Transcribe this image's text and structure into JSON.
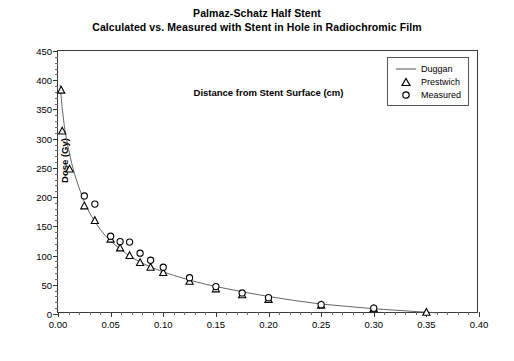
{
  "chart_data": {
    "type": "scatter",
    "title": "Palmaz-Schatz Half Stent",
    "subtitle": "Calculated vs. Measured with Stent in Hole in Radiochromic Film",
    "xlabel": "Distance from Stent Surface (cm)",
    "ylabel": "Dose (Gy)",
    "xlim": [
      0.0,
      0.4
    ],
    "ylim": [
      0,
      450
    ],
    "xticks": [
      "0.00",
      "0.05",
      "0.10",
      "0.15",
      "0.20",
      "0.25",
      "0.30",
      "0.35",
      "0.40"
    ],
    "xtick_values": [
      0.0,
      0.05,
      0.1,
      0.15,
      0.2,
      0.25,
      0.3,
      0.35,
      0.4
    ],
    "yticks": [
      "0",
      "50",
      "100",
      "150",
      "200",
      "250",
      "300",
      "350",
      "400",
      "450"
    ],
    "ytick_values": [
      0,
      50,
      100,
      150,
      200,
      250,
      300,
      350,
      400,
      450
    ],
    "grid": false,
    "legend_position": "top-right-inside",
    "series": [
      {
        "name": "Duggan",
        "marker": "line",
        "style": "solid-thin-line",
        "color": "#555555",
        "x": [
          0.002,
          0.004,
          0.006,
          0.008,
          0.01,
          0.013,
          0.016,
          0.02,
          0.025,
          0.03,
          0.035,
          0.04,
          0.045,
          0.05,
          0.055,
          0.06,
          0.065,
          0.07,
          0.075,
          0.08,
          0.09,
          0.1,
          0.11,
          0.125,
          0.14,
          0.15,
          0.175,
          0.2,
          0.225,
          0.25,
          0.275,
          0.3,
          0.325,
          0.35,
          0.36
        ],
        "y": [
          392,
          352,
          322,
          300,
          282,
          258,
          238,
          216,
          192,
          173,
          158,
          145,
          134,
          125,
          117,
          110,
          103,
          97,
          92,
          87,
          79,
          72,
          66,
          58,
          51,
          47,
          38,
          30,
          23,
          17,
          13,
          9,
          6,
          3,
          2
        ]
      },
      {
        "name": "Prestwich",
        "marker": "triangle",
        "color": "#000000",
        "x": [
          0.003,
          0.004,
          0.011,
          0.025,
          0.035,
          0.05,
          0.059,
          0.068,
          0.078,
          0.088,
          0.1,
          0.125,
          0.15,
          0.175,
          0.2,
          0.25,
          0.3,
          0.35
        ],
        "y": [
          383,
          313,
          248,
          185,
          160,
          128,
          113,
          100,
          88,
          80,
          71,
          56,
          43,
          33,
          25,
          15,
          9,
          3
        ]
      },
      {
        "name": "Measured",
        "marker": "circle",
        "color": "#000000",
        "x": [
          0.025,
          0.035,
          0.05,
          0.059,
          0.068,
          0.078,
          0.088,
          0.1,
          0.125,
          0.15,
          0.175,
          0.2,
          0.25,
          0.3
        ],
        "y": [
          202,
          188,
          133,
          124,
          123,
          104,
          92,
          80,
          62,
          47,
          36,
          28,
          16,
          10
        ]
      }
    ]
  },
  "legend": {
    "items": [
      {
        "label": "Duggan",
        "symbol": "line"
      },
      {
        "label": "Prestwich",
        "symbol": "triangle"
      },
      {
        "label": "Measured",
        "symbol": "circle"
      }
    ]
  }
}
